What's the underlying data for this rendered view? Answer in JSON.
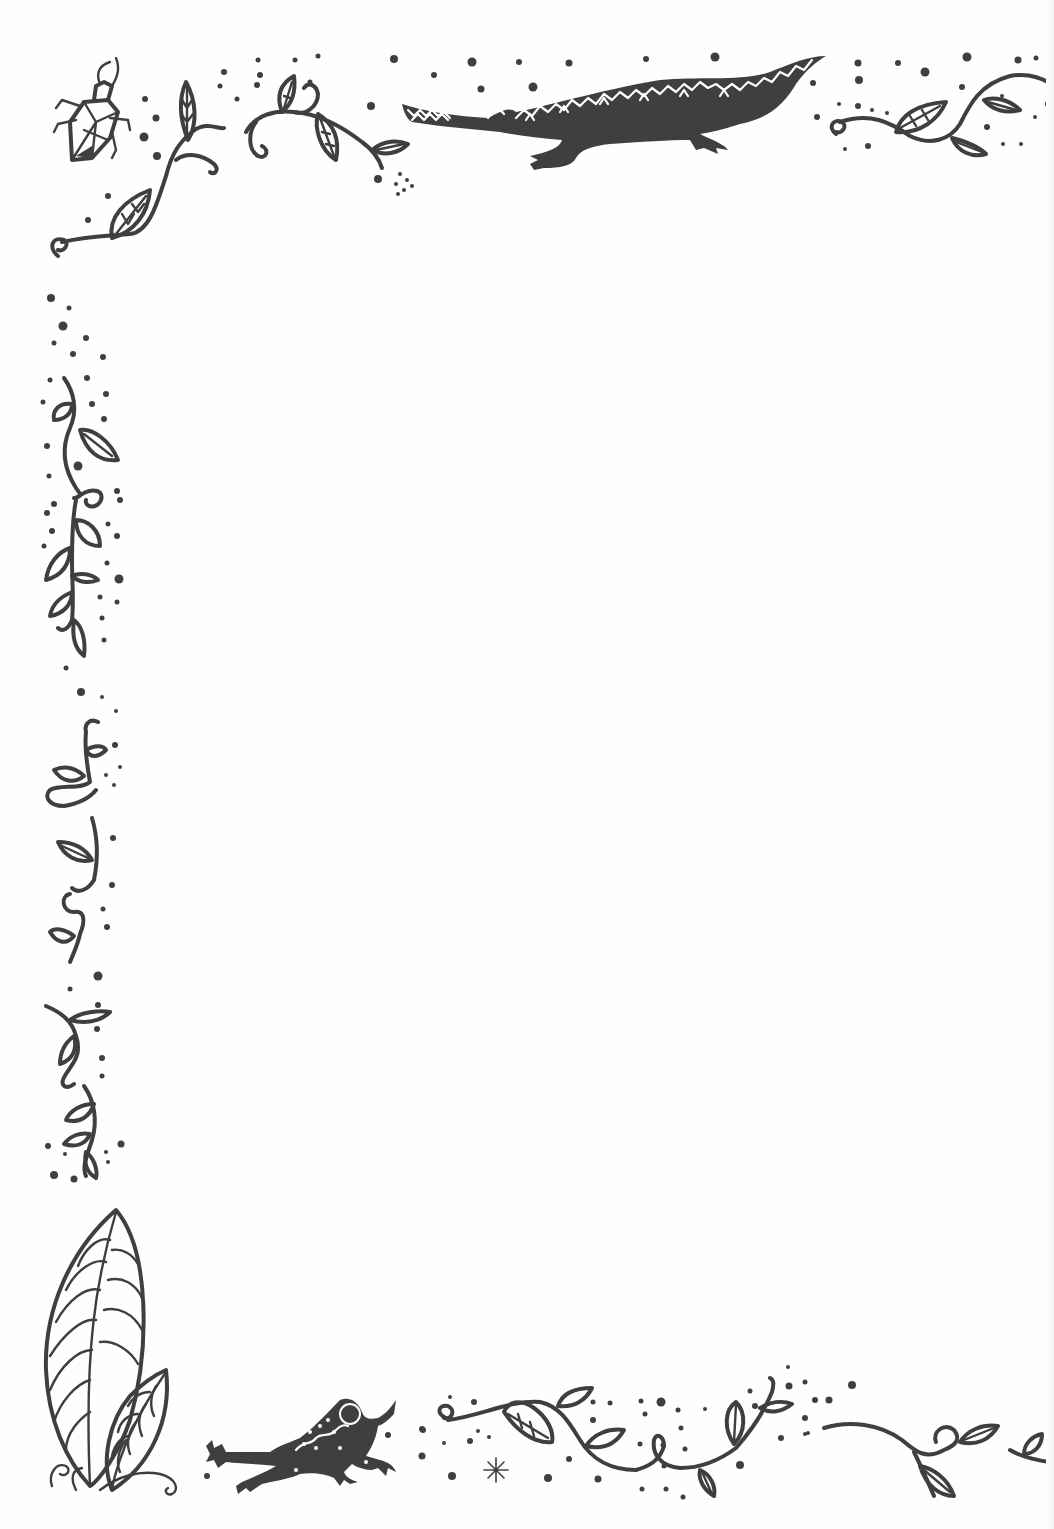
{
  "page": {
    "type": "decorative-border",
    "background": "#fefefe",
    "ink_color": "#3f3f3f"
  },
  "motifs": {
    "top_left": {
      "name": "beetle",
      "vine": "leafy vine with curls"
    },
    "top_center": {
      "name": "crocodile",
      "pattern": "white zigzag back stripes, open toothed jaw"
    },
    "top_right": {
      "name": "leafy vine"
    },
    "left_edge": {
      "name": "climbing vines with leaves and dots"
    },
    "bottom_left": {
      "name": "large patterned leaves with curl tendrils"
    },
    "bottom_center_left": {
      "name": "frog",
      "pattern": "dotted back with wavy stripe"
    },
    "bottom_center": {
      "name": "leafy vine with snowflake"
    },
    "bottom_right": {
      "name": "leafy vine"
    }
  },
  "content_area": {
    "text": ""
  }
}
